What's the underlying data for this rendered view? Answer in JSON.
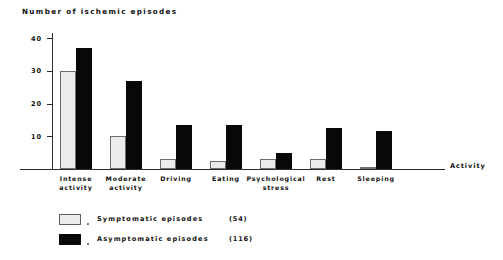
{
  "chart_data": {
    "type": "bar",
    "title": "Number of ischemic episodes",
    "xlabel": "Activity",
    "ylabel": "",
    "ylim": [
      0,
      42
    ],
    "yticks": [
      10,
      20,
      30,
      40
    ],
    "grid": false,
    "legend_position": "bottom-left",
    "categories": [
      "Intense activity",
      "Moderate activity",
      "Driving",
      "Eating",
      "Psychological stress",
      "Rest",
      "Sleeping"
    ],
    "category_lines": [
      [
        "Intense",
        "activity"
      ],
      [
        "Moderate",
        "activity"
      ],
      [
        "Driving",
        ""
      ],
      [
        "Eating",
        ""
      ],
      [
        "Psychological",
        "stress"
      ],
      [
        "Rest",
        ""
      ],
      [
        "Sleeping",
        ""
      ]
    ],
    "series": [
      {
        "name": "Symptomatic episodes",
        "count": 54,
        "count_label": "(54)",
        "color": "#ececec",
        "values": [
          30,
          10,
          3,
          2.5,
          3,
          3,
          0.5
        ]
      },
      {
        "name": "Asymptomatic episodes",
        "count": 116,
        "count_label": "(116)",
        "color": "#080808",
        "values": [
          37,
          27,
          13.5,
          13.5,
          5,
          12.5,
          11.5
        ]
      }
    ]
  },
  "legend": [
    {
      "label": "Symptomatic episodes",
      "count_label": "(54)"
    },
    {
      "label": "Asymptomatic episodes",
      "count_label": "(116)"
    }
  ]
}
